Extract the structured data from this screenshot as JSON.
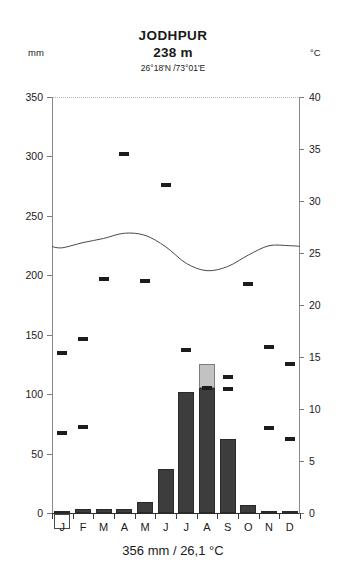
{
  "header": {
    "station": "JODHPUR",
    "altitude": "238 m",
    "coordinates": "26°18'N /73°01'E",
    "unit_left": "mm",
    "unit_right": "°C"
  },
  "footer": {
    "summary": "356 mm / 26,1 °C"
  },
  "colors": {
    "bar_dark": "#3d3d3d",
    "bar_light": "#c2c2c2",
    "curve": "#4a4a4a",
    "mark": "#1c1c1c",
    "axis": "#8a8a8a",
    "dots": "#c9c9c9"
  },
  "chart_data": {
    "type": "bar",
    "title": "JODHPUR",
    "subtitle": "238 m",
    "annotation": "26°18'N /73°01'E",
    "summary": "356 mm / 26,1 °C",
    "annual_precipitation_mm": 356,
    "annual_mean_temp_c": 26.1,
    "categories": [
      "J",
      "F",
      "M",
      "A",
      "M",
      "J",
      "J",
      "A",
      "S",
      "O",
      "N",
      "D"
    ],
    "month_names": [
      "January",
      "February",
      "March",
      "April",
      "May",
      "June",
      "July",
      "August",
      "September",
      "October",
      "November",
      "December"
    ],
    "xlabel": "",
    "ylabel": "mm",
    "y2label": "°C",
    "ylim": [
      0,
      350
    ],
    "y2lim": [
      0,
      40
    ],
    "yticks": [
      0,
      50,
      100,
      150,
      200,
      250,
      300,
      350
    ],
    "y2ticks": [
      0,
      5,
      10,
      15,
      20,
      25,
      30,
      35,
      40
    ],
    "grid": false,
    "legend": "none",
    "series": [
      {
        "name": "Precipitation",
        "unit": "mm",
        "axis": "left",
        "type": "bar",
        "values": [
          2,
          3,
          3,
          3,
          9,
          37,
          102,
          125,
          62,
          7,
          2,
          2
        ]
      },
      {
        "name": "Precipitation above 100 mm",
        "unit": "mm",
        "axis": "left",
        "type": "bar-overflow",
        "values": [
          0,
          0,
          0,
          0,
          0,
          0,
          0,
          20,
          0,
          0,
          0,
          0
        ]
      },
      {
        "name": "Mean temperature",
        "unit": "°C",
        "axis": "right",
        "type": "line",
        "values": [
          25.5,
          26.0,
          26.4,
          26.9,
          26.7,
          25.6,
          24.0,
          23.3,
          23.7,
          24.8,
          25.7,
          25.7
        ]
      },
      {
        "name": "Temperature extreme marks",
        "unit": "°C",
        "axis": "right",
        "type": "marker",
        "values": [
          15.4,
          16.7,
          22.5,
          34.5,
          22.3,
          31.5,
          15.7,
          12.0,
          13.1,
          22.0,
          16.0,
          14.3
        ]
      },
      {
        "name": "Low temperature marks",
        "unit": "°C",
        "axis": "right",
        "type": "marker-low",
        "values": [
          7.7,
          8.3,
          null,
          null,
          null,
          null,
          null,
          null,
          11.9,
          null,
          8.2,
          7.1
        ]
      }
    ]
  },
  "axis_left_labels": [
    "350",
    "300",
    "250",
    "200",
    "150",
    "100",
    "50",
    "0"
  ],
  "axis_right_labels": [
    "40",
    "35",
    "30",
    "25",
    "20",
    "15",
    "10",
    "5",
    "0"
  ]
}
